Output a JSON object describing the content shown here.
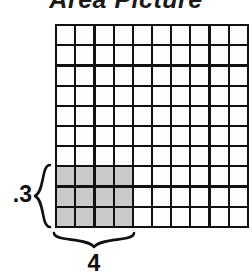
{
  "figure": {
    "title": "Area Picture",
    "type": "area-model-grid"
  },
  "grid": {
    "columns": 10,
    "rows": 10,
    "line_color": "#111111",
    "cell_color": "#fdfdfd",
    "shaded_color": "#c9c9c9",
    "shaded_columns": 4,
    "shaded_rows": 3,
    "shaded_origin": "bottom-left"
  },
  "labels": {
    "height": ".3",
    "width": "4",
    "height_brace": "left-curly-brace",
    "width_brace": "bottom-curly-brace"
  },
  "chart_data": {
    "type": "heatmap",
    "title": "Area Picture",
    "xlabel": "",
    "ylabel": "",
    "grid": true,
    "columns": 10,
    "rows": 10,
    "x": [
      1,
      2,
      3,
      4,
      5,
      6,
      7,
      8,
      9,
      10
    ],
    "y": [
      1,
      2,
      3,
      4,
      5,
      6,
      7,
      8,
      9,
      10
    ],
    "shaded_region": {
      "label_width": "4",
      "label_height": ".3",
      "width_cells": 4,
      "height_cells": 3,
      "origin": "bottom-left",
      "cell_count": 12,
      "fill": "#c9c9c9"
    },
    "values": [
      [
        0,
        0,
        0,
        0,
        0,
        0,
        0,
        0,
        0,
        0
      ],
      [
        0,
        0,
        0,
        0,
        0,
        0,
        0,
        0,
        0,
        0
      ],
      [
        0,
        0,
        0,
        0,
        0,
        0,
        0,
        0,
        0,
        0
      ],
      [
        0,
        0,
        0,
        0,
        0,
        0,
        0,
        0,
        0,
        0
      ],
      [
        0,
        0,
        0,
        0,
        0,
        0,
        0,
        0,
        0,
        0
      ],
      [
        0,
        0,
        0,
        0,
        0,
        0,
        0,
        0,
        0,
        0
      ],
      [
        0,
        0,
        0,
        0,
        0,
        0,
        0,
        0,
        0,
        0
      ],
      [
        1,
        1,
        1,
        1,
        0,
        0,
        0,
        0,
        0,
        0
      ],
      [
        1,
        1,
        1,
        1,
        0,
        0,
        0,
        0,
        0,
        0
      ],
      [
        1,
        1,
        1,
        1,
        0,
        0,
        0,
        0,
        0,
        0
      ]
    ],
    "legend": [],
    "annotations": [
      {
        "text": ".3",
        "position": "left-of-shaded-region"
      },
      {
        "text": "4",
        "position": "below-shaded-region"
      }
    ]
  }
}
